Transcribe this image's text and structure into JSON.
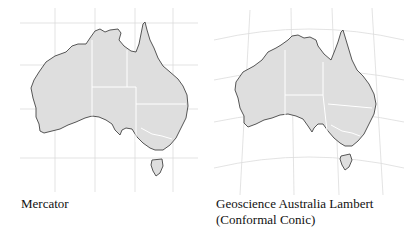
{
  "panels": [
    {
      "id": "mercator",
      "caption": "Mercator",
      "caption_lines": [
        "Mercator"
      ]
    },
    {
      "id": "lambert",
      "caption": "Geoscience Australia Lambert (Conformal Conic)",
      "caption_lines": [
        "Geoscience Australia Lambert",
        "(Conformal Conic)"
      ]
    }
  ],
  "colors": {
    "land": "#dedede",
    "coast": "#444444",
    "grid": "#dcdcdc",
    "borders": "#ffffff",
    "background": "#ffffff"
  }
}
